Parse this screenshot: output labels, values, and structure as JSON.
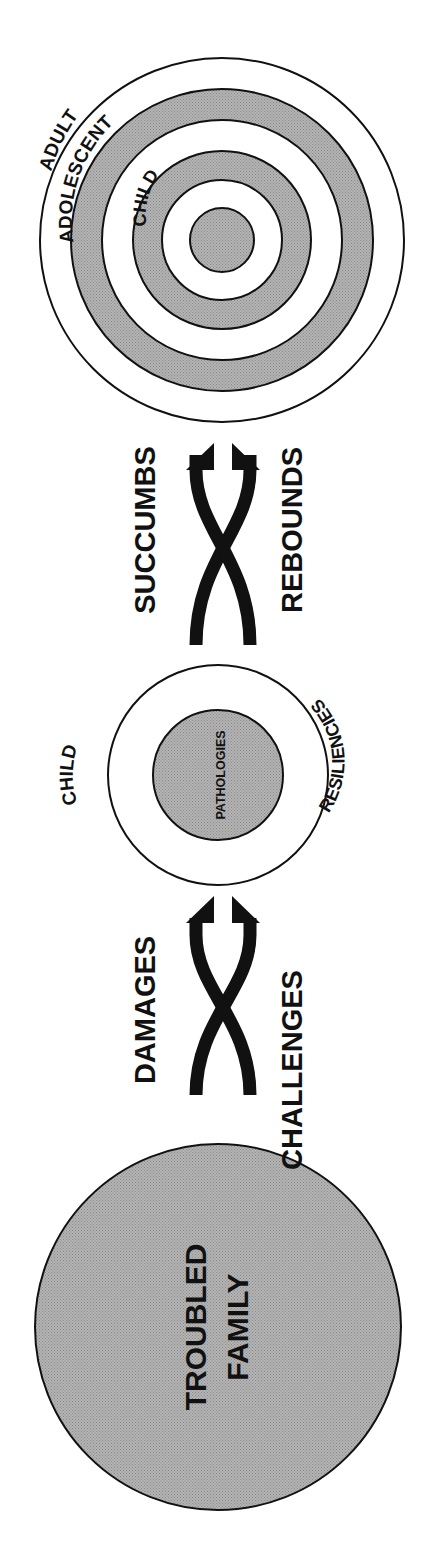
{
  "diagram": {
    "orientation": "rotated-90-ccw",
    "colors": {
      "shade": "#a9a9a9",
      "ink": "#111111",
      "background": "#ffffff"
    },
    "troubled_family": {
      "line1": "TROUBLED",
      "line2": "FAMILY"
    },
    "first_transition": {
      "top_label": "DAMAGES",
      "bottom_label": "CHALLENGES"
    },
    "child_stage": {
      "outer_label": "CHILD",
      "inner_label": "PATHOLOGIES",
      "ring_label": "RESILIENCIES"
    },
    "second_transition": {
      "top_label": "SUCCUMBS",
      "bottom_label": "REBOUNDS"
    },
    "target": {
      "rings": [
        "ADULT",
        "ADOLESCENT",
        "CHILD"
      ]
    }
  }
}
